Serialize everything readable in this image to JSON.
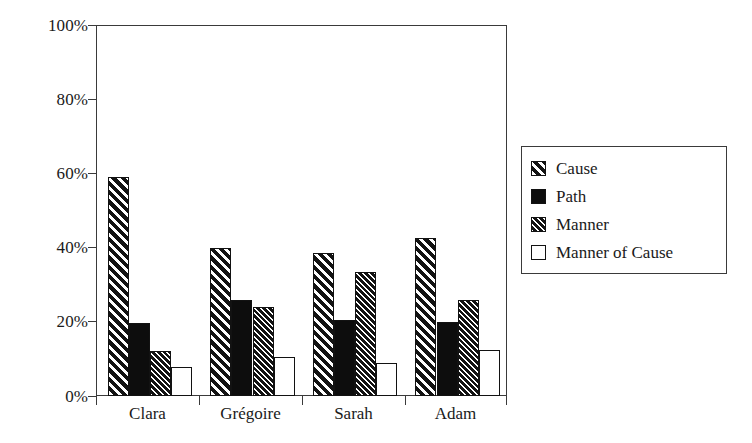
{
  "chart_data": {
    "type": "bar",
    "title": "",
    "subtitle": "",
    "xlabel": "",
    "ylabel": "",
    "categories": [
      "Clara",
      "Grégoire",
      "Sarah",
      "Adam"
    ],
    "series": [
      {
        "name": "Cause",
        "pattern": "wide-diagonal-hatch",
        "values": [
          59,
          40,
          38.5,
          42.5
        ]
      },
      {
        "name": "Path",
        "pattern": "solid-black",
        "values": [
          19.8,
          26,
          20.5,
          20
        ]
      },
      {
        "name": "Manner",
        "pattern": "fine-diagonal-hatch",
        "values": [
          12,
          24,
          33.5,
          26
        ]
      },
      {
        "name": "Manner of Cause",
        "pattern": "empty-white",
        "values": [
          7.8,
          10.5,
          9,
          12.5
        ]
      }
    ],
    "ylim": [
      0,
      100
    ],
    "ytick_labels": [
      "0%",
      "20%",
      "40%",
      "60%",
      "80%",
      "100%"
    ],
    "ytick_values": [
      0,
      20,
      40,
      60,
      80,
      100
    ],
    "grid": false,
    "legend_position": "right",
    "value_suffix": "%"
  },
  "legend": {
    "entries": [
      {
        "label": "Cause"
      },
      {
        "label": "Path"
      },
      {
        "label": "Manner"
      },
      {
        "label": "Manner of Cause"
      }
    ]
  },
  "colors": {
    "axis": "#3a3a3a",
    "bar_outline": "#121212",
    "fill_dark": "#131313",
    "fill_light": "#ffffff",
    "background": "#ffffff"
  }
}
